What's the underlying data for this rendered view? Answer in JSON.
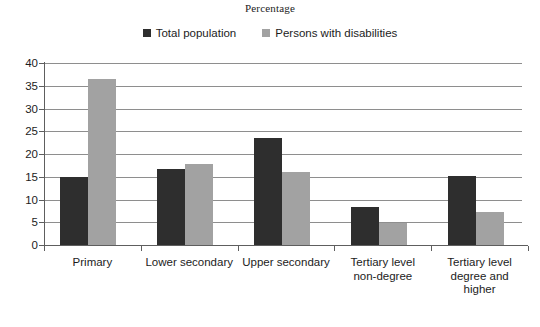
{
  "chart_data": {
    "type": "bar",
    "title": "Percentage",
    "xlabel": "",
    "ylabel": "",
    "ylim": [
      0,
      40
    ],
    "yticks": [
      0,
      5,
      10,
      15,
      20,
      25,
      30,
      35,
      40
    ],
    "grid": true,
    "legend_position": "top-center",
    "categories": [
      "Primary",
      "Lower secondary",
      "Upper secondary",
      "Tertiary level non-degree",
      "Tertiary level degree and higher"
    ],
    "category_lines": [
      [
        "Primary"
      ],
      [
        "Lower secondary"
      ],
      [
        "Upper secondary"
      ],
      [
        "Tertiary level",
        "non-degree"
      ],
      [
        "Tertiary level",
        "degree and",
        "higher"
      ]
    ],
    "series": [
      {
        "name": "Total population",
        "color": "#2e2e2e",
        "values": [
          15.0,
          16.7,
          23.5,
          8.3,
          15.2
        ]
      },
      {
        "name": "Persons with disabilities",
        "color": "#a2a2a2",
        "values": [
          36.5,
          17.8,
          16.1,
          4.8,
          7.3
        ]
      }
    ]
  },
  "colors": {
    "series_total_population": "#2e2e2e",
    "series_persons_with_disabilities": "#a2a2a2",
    "gridline": "#8e8e8e",
    "axis": "#5e5e5e",
    "background": "#ffffff",
    "text": "#1c1c1c"
  }
}
